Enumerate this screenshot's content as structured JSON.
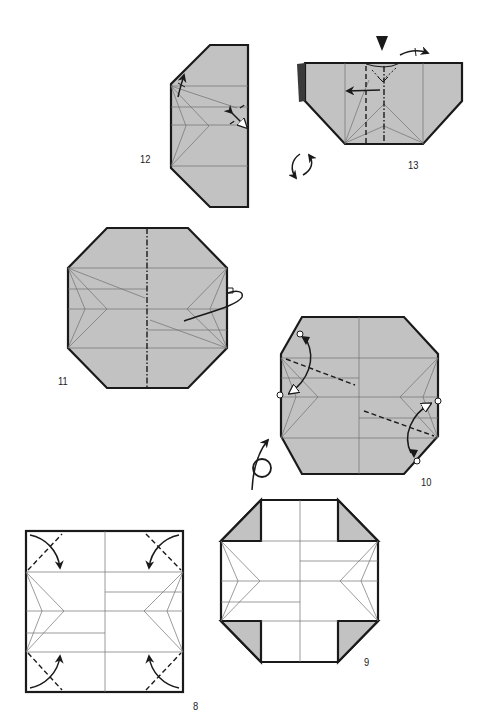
{
  "page": {
    "type": "origami-instruction-diagram",
    "background": "#ffffff"
  },
  "colors": {
    "paper_color_side": "#c2c2c2",
    "paper_white_side": "#ffffff",
    "edge": "#1a1a1a",
    "crease": "#707070"
  },
  "steps": [
    {
      "number": "8",
      "description": "Valley-fold the four corners in along the diagonals."
    },
    {
      "number": "9",
      "description": "Corners folded in; coloured triangles visible."
    },
    {
      "number": "10",
      "description": "Fold corners so circled points meet; turn the model over."
    },
    {
      "number": "11",
      "description": "Mountain-fold the model in half along the centre line, folding behind."
    },
    {
      "number": "12",
      "description": "Reverse-fold / open slightly as shown by the arrows."
    },
    {
      "number": "13",
      "description": "Squash-fold at the top, fold flap to the left; rotate the model."
    }
  ],
  "symbols": {
    "turn_over": "turn-over-icon",
    "rotate": "rotate-icon",
    "push": "push-arrow-icon",
    "fold_behind": "fold-behind-icon"
  }
}
